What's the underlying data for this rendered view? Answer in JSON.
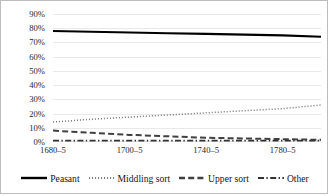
{
  "chart_data": {
    "type": "line",
    "title": "",
    "subtitle": "",
    "xlabel": "",
    "ylabel": "",
    "grid": true,
    "legend_position": "bottom",
    "ylim": [
      0,
      90
    ],
    "ytick_labels": [
      "90%",
      "80%",
      "70%",
      "60%",
      "50%",
      "40%",
      "30%",
      "20%",
      "10%",
      "0%"
    ],
    "ytick_values": [
      90,
      80,
      70,
      60,
      50,
      40,
      30,
      20,
      10,
      0
    ],
    "x": [
      0,
      1,
      2,
      3,
      4,
      5,
      6,
      7
    ],
    "xtick_labels": [
      "1680–5",
      "",
      "1700–5",
      "",
      "1740–5",
      "",
      "1780–5",
      ""
    ],
    "xtick_labels_shown": [
      "1680–5",
      "1700–5",
      "1740–5",
      "1780–5"
    ],
    "xtick_positions_shown": [
      0,
      2,
      4,
      6
    ],
    "series": [
      {
        "name": "Peasant",
        "style": "solid",
        "color": "#000000",
        "values": [
          78,
          77.5,
          77,
          76.5,
          76,
          75.5,
          75,
          74
        ]
      },
      {
        "name": "Middling sort",
        "style": "dotted",
        "color": "#7f7f7f",
        "values": [
          14,
          16,
          17.5,
          19,
          20.5,
          22,
          23.5,
          26
        ]
      },
      {
        "name": "Upper sort",
        "style": "dashed",
        "color": "#404040",
        "values": [
          8,
          6.5,
          5,
          4,
          3,
          2.5,
          2,
          1.5
        ]
      },
      {
        "name": "Other",
        "style": "dashdot",
        "color": "#333333",
        "values": [
          1,
          1,
          1,
          1,
          1,
          1,
          1,
          1
        ]
      }
    ]
  },
  "legend": {
    "items": [
      {
        "label": "Peasant",
        "style": "solid"
      },
      {
        "label": "Middling sort",
        "style": "dotted"
      },
      {
        "label": "Upper sort",
        "style": "dashed"
      },
      {
        "label": "Other",
        "style": "dashdot"
      }
    ]
  }
}
